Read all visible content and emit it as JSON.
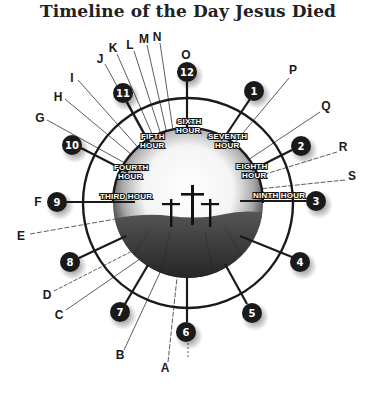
{
  "title": "Timeline of the Day Jesus Died",
  "hours": [
    {
      "num": "12",
      "x": 187,
      "y": 72
    },
    {
      "num": "1",
      "x": 254,
      "y": 91
    },
    {
      "num": "2",
      "x": 301,
      "y": 146
    },
    {
      "num": "3",
      "x": 316,
      "y": 201
    },
    {
      "num": "4",
      "x": 300,
      "y": 262
    },
    {
      "num": "5",
      "x": 252,
      "y": 313
    },
    {
      "num": "6",
      "x": 186,
      "y": 332
    },
    {
      "num": "7",
      "x": 120,
      "y": 312
    },
    {
      "num": "8",
      "x": 70,
      "y": 262
    },
    {
      "num": "9",
      "x": 57,
      "y": 202
    },
    {
      "num": "10",
      "x": 72,
      "y": 145
    },
    {
      "num": "11",
      "x": 123,
      "y": 93
    }
  ],
  "hour_labels": [
    {
      "line1": "THIRD HOUR",
      "line2": ""
    },
    {
      "line1": "FOURTH",
      "line2": "HOUR"
    },
    {
      "line1": "FIFTH",
      "line2": "HOUR"
    },
    {
      "line1": "SIXTH",
      "line2": "HOUR"
    },
    {
      "line1": "SEVENTH",
      "line2": "HOUR"
    },
    {
      "line1": "EIGHTH",
      "line2": "HOUR"
    },
    {
      "line1": "NINTH HOUR",
      "line2": ""
    }
  ],
  "letters": [
    {
      "id": "A",
      "x": 165,
      "y": 372
    },
    {
      "id": "B",
      "x": 120,
      "y": 359
    },
    {
      "id": "C",
      "x": 59,
      "y": 319
    },
    {
      "id": "D",
      "x": 47,
      "y": 299
    },
    {
      "id": "E",
      "x": 21,
      "y": 240
    },
    {
      "id": "F",
      "x": 38,
      "y": 206
    },
    {
      "id": "G",
      "x": 40,
      "y": 122
    },
    {
      "id": "H",
      "x": 58,
      "y": 101
    },
    {
      "id": "I",
      "x": 72,
      "y": 82
    },
    {
      "id": "J",
      "x": 100,
      "y": 63
    },
    {
      "id": "K",
      "x": 113,
      "y": 52
    },
    {
      "id": "L",
      "x": 130,
      "y": 49
    },
    {
      "id": "M",
      "x": 144,
      "y": 43
    },
    {
      "id": "N",
      "x": 157,
      "y": 41
    },
    {
      "id": "O",
      "x": 186,
      "y": 59
    },
    {
      "id": "P",
      "x": 293,
      "y": 74
    },
    {
      "id": "Q",
      "x": 326,
      "y": 110
    },
    {
      "id": "R",
      "x": 343,
      "y": 151
    },
    {
      "id": "S",
      "x": 352,
      "y": 180
    }
  ],
  "colors": {
    "ink": "#1a1a1a",
    "hill": "#3a3a3a",
    "bg": "#ffffff"
  }
}
